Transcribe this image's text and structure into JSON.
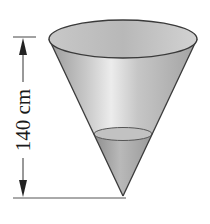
{
  "figure": {
    "type": "conical container diagram",
    "dimension_label": "140 cm",
    "dimension_orientation": "vertical",
    "shapes": {
      "cone": "inverted right circular cone with open top",
      "liquid": "water filled near apex"
    },
    "colors": {
      "outline": "#3a3a3a",
      "cone_fill": "#bdbdbd",
      "cone_highlight": "#e8e8e8",
      "liquid_fill": "#a8a8a8",
      "surface_fill": "#c4c4c4",
      "background": "#ffffff"
    }
  }
}
